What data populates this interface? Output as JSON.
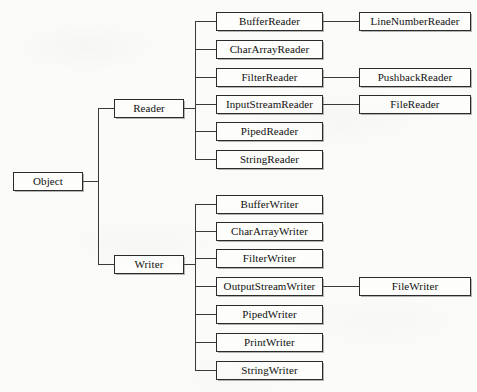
{
  "diagram": {
    "type": "tree-diagram",
    "background_color": "#fbfbf9",
    "box_border_color": "#2b2b2b",
    "line_color": "#3a3a3a",
    "text_color": "#101010",
    "root": {
      "label": "Object"
    },
    "branches": [
      {
        "label": "Reader",
        "children": [
          {
            "label": "BufferReader",
            "children": [
              {
                "label": "LineNumberReader"
              }
            ]
          },
          {
            "label": "CharArrayReader",
            "children": []
          },
          {
            "label": "FilterReader",
            "children": [
              {
                "label": "PushbackReader"
              }
            ]
          },
          {
            "label": "InputStreamReader",
            "children": [
              {
                "label": "FileReader"
              }
            ]
          },
          {
            "label": "PipedReader",
            "children": []
          },
          {
            "label": "StringReader",
            "children": []
          }
        ]
      },
      {
        "label": "Writer",
        "children": [
          {
            "label": "BufferWriter",
            "children": []
          },
          {
            "label": "CharArrayWriter",
            "children": []
          },
          {
            "label": "FilterWriter",
            "children": []
          },
          {
            "label": "OutputStreamWriter",
            "children": [
              {
                "label": "FileWriter"
              }
            ]
          },
          {
            "label": "PipedWriter",
            "children": []
          },
          {
            "label": "PrintWriter",
            "children": []
          },
          {
            "label": "StringWriter",
            "children": []
          }
        ]
      }
    ]
  }
}
